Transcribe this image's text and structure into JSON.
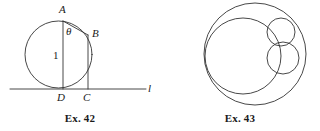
{
  "sheet": {
    "background_color": "#ffffff",
    "stroke_color": "#333333",
    "text_color": "#1a1a1a",
    "width": 320,
    "height": 131
  },
  "figures": [
    {
      "id": "ex42",
      "caption": "Ex. 42",
      "description": "Circle tangent to line l at D with vertical diameter AD of length 1, chord AB, and perpendicular BC dropped to line l.",
      "geometry": {
        "circle": {
          "cx": 58.5,
          "cy": 54.5,
          "r": 33.5
        },
        "line_l": {
          "x1": 10,
          "y1": 89,
          "x2": 146,
          "y2": 89
        },
        "segment_AD": {
          "x1": 63,
          "y1": 21,
          "x2": 63,
          "y2": 89
        },
        "segment_AB": {
          "x1": 63,
          "y1": 21,
          "x2": 88,
          "y2": 35
        },
        "segment_BC": {
          "x1": 88,
          "y1": 35,
          "x2": 88,
          "y2": 89
        }
      },
      "labels": [
        {
          "name": "point-a",
          "text": "A",
          "x": 59,
          "y": 4,
          "italic": true
        },
        {
          "name": "angle-theta",
          "text": "θ",
          "x": 66,
          "y": 26,
          "italic": true
        },
        {
          "name": "length-one",
          "text": "1",
          "x": 53,
          "y": 50,
          "italic": false
        },
        {
          "name": "point-b",
          "text": "B",
          "x": 92,
          "y": 28,
          "italic": true
        },
        {
          "name": "point-d",
          "text": "D",
          "x": 57,
          "y": 92,
          "italic": true
        },
        {
          "name": "point-c",
          "text": "C",
          "x": 83,
          "y": 92,
          "italic": true
        },
        {
          "name": "line-l",
          "text": "l",
          "x": 148,
          "y": 83,
          "italic": true
        }
      ]
    },
    {
      "id": "ex43",
      "caption": "Ex. 43",
      "description": "A large outer circle containing one large inner circle and two smaller circles, all mutually tangent.",
      "geometry": {
        "outer_circle": {
          "cx": 95,
          "cy": 54,
          "r": 51
        },
        "inner_circles": [
          {
            "name": "large-inner-circle",
            "cx": 83,
            "cy": 56,
            "r": 38
          },
          {
            "name": "top-small-circle",
            "cx": 121,
            "cy": 32,
            "r": 14
          },
          {
            "name": "right-small-circle",
            "cx": 123,
            "cy": 58,
            "r": 16
          }
        ]
      },
      "labels": []
    }
  ]
}
